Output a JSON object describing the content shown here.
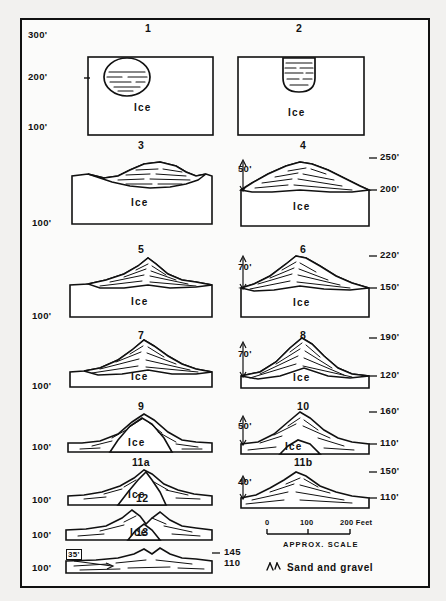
{
  "figure": {
    "title_hidden": "",
    "ice_label": "Ice",
    "axis": {
      "ticks": [
        "300'",
        "200'",
        "100'"
      ]
    },
    "panels": [
      {
        "id": "p1",
        "number": "1",
        "ice_label": "Ice",
        "left_elevs": [
          "300'",
          "200'",
          "100'"
        ],
        "right_elevs": [],
        "arrow_label": ""
      },
      {
        "id": "p2",
        "number": "2",
        "ice_label": "Ice",
        "left_elevs": [],
        "right_elevs": [],
        "arrow_label": ""
      },
      {
        "id": "p3",
        "number": "3",
        "ice_label": "Ice",
        "left_elevs": [
          "100'"
        ],
        "right_elevs": [],
        "arrow_label": ""
      },
      {
        "id": "p4",
        "number": "4",
        "ice_label": "Ice",
        "left_elevs": [],
        "right_elevs": [
          "250'",
          "200'"
        ],
        "arrow_label": "50'"
      },
      {
        "id": "p5",
        "number": "5",
        "ice_label": "Ice",
        "left_elevs": [
          "100'"
        ],
        "right_elevs": [],
        "arrow_label": ""
      },
      {
        "id": "p6",
        "number": "6",
        "ice_label": "Ice",
        "left_elevs": [],
        "right_elevs": [
          "220'",
          "150'"
        ],
        "arrow_label": "70'"
      },
      {
        "id": "p7",
        "number": "7",
        "ice_label": "Ice",
        "left_elevs": [
          "100'"
        ],
        "right_elevs": [],
        "arrow_label": ""
      },
      {
        "id": "p8",
        "number": "8",
        "ice_label": "Ice",
        "left_elevs": [],
        "right_elevs": [
          "190'",
          "120'"
        ],
        "arrow_label": "70'"
      },
      {
        "id": "p9",
        "number": "9",
        "ice_label": "Ice",
        "left_elevs": [
          "100'"
        ],
        "right_elevs": [],
        "arrow_label": ""
      },
      {
        "id": "p10",
        "number": "10",
        "ice_label": "Ice",
        "left_elevs": [],
        "right_elevs": [
          "160'",
          "110'"
        ],
        "arrow_label": "50'"
      },
      {
        "id": "p11a",
        "number": "11a",
        "ice_label": "Ice",
        "left_elevs": [
          "100'"
        ],
        "right_elevs": [],
        "arrow_label": ""
      },
      {
        "id": "p11b",
        "number": "11b",
        "ice_label": "",
        "left_elevs": [],
        "right_elevs": [
          "150'",
          "110'"
        ],
        "arrow_label": "40'"
      },
      {
        "id": "p12",
        "number": "12",
        "ice_label": "Ice",
        "left_elevs": [
          "100'"
        ],
        "right_elevs": [],
        "arrow_label": ""
      },
      {
        "id": "p13",
        "number": "13",
        "ice_label": "",
        "left_elevs": [
          "100'"
        ],
        "right_elevs": [
          "145",
          "110"
        ],
        "arrow_label": "35'"
      }
    ],
    "scale": {
      "ticks": [
        "0",
        "100",
        "200 Feet"
      ],
      "caption": "APPROX.  SCALE"
    },
    "legend": {
      "symbol": "sand-gravel-symbol",
      "label": "Sand and gravel"
    }
  }
}
